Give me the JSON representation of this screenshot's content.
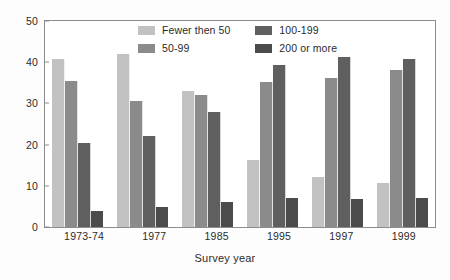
{
  "chart_data": {
    "type": "bar",
    "title": "",
    "subtitle": "",
    "xlabel": "Survey year",
    "ylabel": "",
    "categories": [
      "1973-74",
      "1977",
      "1985",
      "1995",
      "1997",
      "1999"
    ],
    "series": [
      {
        "name": "Fewer then 50",
        "color": "#c2c2c2",
        "values": [
          40.7,
          42.0,
          33.0,
          16.2,
          12.1,
          10.7
        ]
      },
      {
        "name": "50-99",
        "color": "#8b8b8b",
        "values": [
          35.4,
          30.6,
          32.0,
          35.1,
          36.2,
          38.0
        ]
      },
      {
        "name": "100-199",
        "color": "#5f5f5f",
        "values": [
          20.4,
          22.0,
          27.8,
          39.3,
          41.3,
          40.8
        ]
      },
      {
        "name": "200 or more",
        "color": "#4b4b4b",
        "values": [
          3.8,
          4.8,
          6.0,
          7.1,
          6.9,
          7.0
        ]
      }
    ],
    "ylim": [
      0,
      50
    ],
    "yticks": [
      "0",
      "10",
      "20",
      "30",
      "40",
      "50"
    ],
    "ytick_values": [
      0,
      10,
      20,
      30,
      40,
      50
    ],
    "grid": false,
    "legend_position": "inside-top-center",
    "frame": true,
    "axis_color": "#8d8d8d"
  },
  "legend": {
    "entries": [
      {
        "label": "Fewer then 50"
      },
      {
        "label": "100-199"
      },
      {
        "label": "50-99"
      },
      {
        "label": "200 or more"
      }
    ]
  }
}
